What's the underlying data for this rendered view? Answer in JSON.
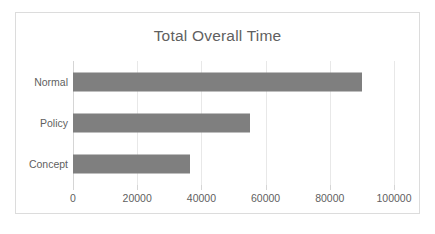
{
  "chart_data": {
    "type": "bar",
    "orientation": "horizontal",
    "title": "Total Overall Time",
    "xlabel": "",
    "ylabel": "",
    "categories": [
      "Concept",
      "Policy",
      "Normal"
    ],
    "values": [
      36500,
      55000,
      90000
    ],
    "xlim": [
      0,
      100000
    ],
    "xticks": [
      0,
      20000,
      40000,
      60000,
      80000,
      100000
    ],
    "xtick_labels": [
      "0",
      "20000",
      "40000",
      "60000",
      "80000",
      "100000"
    ],
    "grid": true,
    "grid_axis": "x",
    "legend": false,
    "series": [
      {
        "name": "Total Overall Time",
        "values": [
          36500,
          55000,
          90000
        ],
        "color": "#7f7f7f"
      }
    ],
    "bar_color": "#7f7f7f",
    "title_color": "#5f5f5f",
    "tick_color": "#5f5f5f",
    "gridline_color": "#e8e8e8",
    "border_color": "#dcdcdc",
    "background": "#ffffff"
  }
}
